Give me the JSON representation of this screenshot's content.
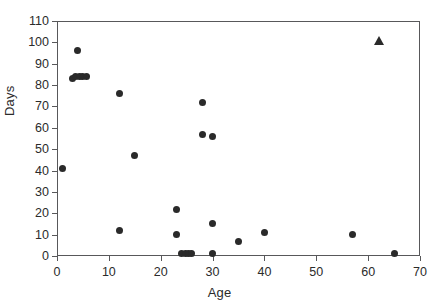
{
  "chart_data": {
    "type": "scatter",
    "title": "",
    "xlabel": "Age",
    "ylabel": "Days",
    "xlim": [
      0,
      70
    ],
    "ylim": [
      0,
      110
    ],
    "xticks": [
      0,
      10,
      20,
      30,
      40,
      50,
      60,
      70
    ],
    "yticks": [
      0,
      10,
      20,
      30,
      40,
      50,
      60,
      70,
      80,
      90,
      100,
      110
    ],
    "grid": false,
    "legend": "none",
    "marker_color": "#2a2a2a",
    "frame_color": "#58585a",
    "series": [
      {
        "name": "circles",
        "marker": "circle",
        "points": [
          {
            "x": 1,
            "y": 41
          },
          {
            "x": 4,
            "y": 96
          },
          {
            "x": 3,
            "y": 83
          },
          {
            "x": 3.6,
            "y": 84
          },
          {
            "x": 4.3,
            "y": 84
          },
          {
            "x": 5,
            "y": 84
          },
          {
            "x": 5.6,
            "y": 84
          },
          {
            "x": 12,
            "y": 76
          },
          {
            "x": 12,
            "y": 12
          },
          {
            "x": 15,
            "y": 47
          },
          {
            "x": 23,
            "y": 22
          },
          {
            "x": 23,
            "y": 10
          },
          {
            "x": 24,
            "y": 1
          },
          {
            "x": 24.7,
            "y": 1
          },
          {
            "x": 25.4,
            "y": 1
          },
          {
            "x": 26,
            "y": 1
          },
          {
            "x": 28,
            "y": 72
          },
          {
            "x": 28,
            "y": 57
          },
          {
            "x": 30,
            "y": 56
          },
          {
            "x": 30,
            "y": 15
          },
          {
            "x": 30,
            "y": 1
          },
          {
            "x": 35,
            "y": 7
          },
          {
            "x": 40,
            "y": 11
          },
          {
            "x": 57,
            "y": 10
          },
          {
            "x": 65,
            "y": 1
          }
        ]
      },
      {
        "name": "triangles",
        "marker": "triangle",
        "points": [
          {
            "x": 62,
            "y": 101
          }
        ]
      }
    ]
  }
}
